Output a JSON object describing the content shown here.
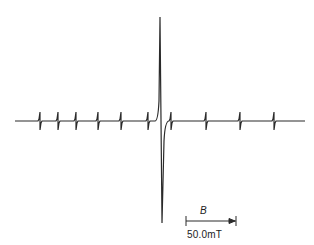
{
  "chart_data": {
    "type": "line",
    "title": "",
    "xlabel": "B",
    "ylabel": "",
    "grid": false,
    "legend": null,
    "scale_bar": {
      "label": "50.0mT",
      "symbol": "B",
      "direction": "increasing-right"
    },
    "baseline_y_px": 121,
    "central_line": {
      "x_px": 161,
      "top_px": 17,
      "bottom_px": 223
    },
    "satellite_lines_x_px": [
      40,
      58,
      76,
      98,
      121,
      148,
      171,
      206,
      240,
      274
    ],
    "x_range_px": [
      15,
      305
    ]
  },
  "labels": {
    "field_symbol": "B",
    "scale": "50.0mT"
  },
  "colors": {
    "trace": "#2a2a2a",
    "background": "#ffffff"
  }
}
